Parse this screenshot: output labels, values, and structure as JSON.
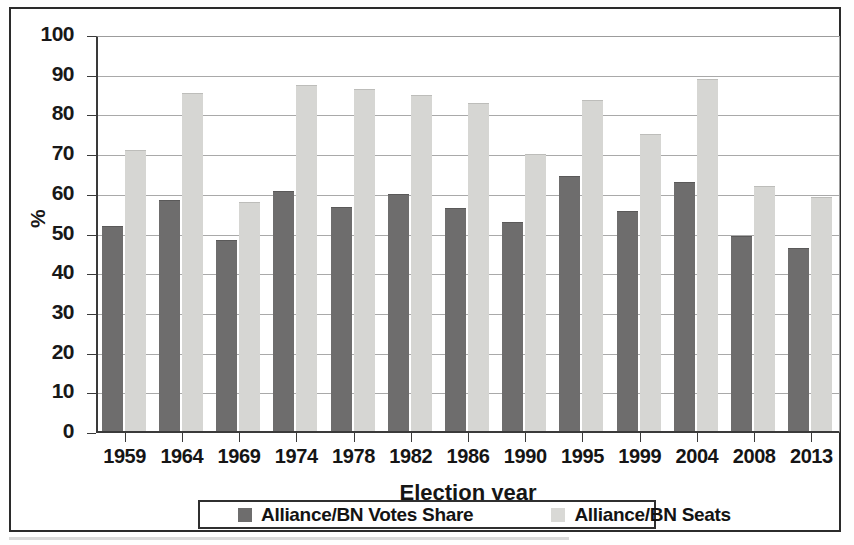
{
  "chart_data": {
    "type": "bar",
    "title": "",
    "xlabel": "Election year",
    "ylabel": "%",
    "ylim": [
      0,
      100
    ],
    "ytick_step": 10,
    "yticks": [
      100,
      90,
      80,
      70,
      60,
      50,
      40,
      30,
      20,
      10,
      0
    ],
    "grid": true,
    "legend_position": "bottom",
    "categories": [
      "1959",
      "1964",
      "1969",
      "1974",
      "1978",
      "1982",
      "1986",
      "1990",
      "1995",
      "1999",
      "2004",
      "2008",
      "2013"
    ],
    "series": [
      {
        "name": "Alliance/BN Votes Share",
        "color": "#6e6d6d",
        "values": [
          51.8,
          58.5,
          48.4,
          60.8,
          56.7,
          60.0,
          56.5,
          52.8,
          64.5,
          55.7,
          62.9,
          49.3,
          46.3
        ]
      },
      {
        "name": "Alliance/BN Seats",
        "color": "#d6d6d3",
        "values": [
          71.0,
          85.3,
          58.0,
          87.4,
          86.5,
          84.9,
          83.0,
          70.0,
          83.7,
          75.0,
          89.0,
          62.0,
          59.2
        ]
      }
    ]
  },
  "legend": {
    "entries": [
      {
        "label": "Alliance/BN Votes Share",
        "swatch": "votes"
      },
      {
        "label": "Alliance/BN Seats",
        "swatch": "seats"
      }
    ]
  },
  "axes": {
    "y_label": "%",
    "x_label": "Election year"
  }
}
